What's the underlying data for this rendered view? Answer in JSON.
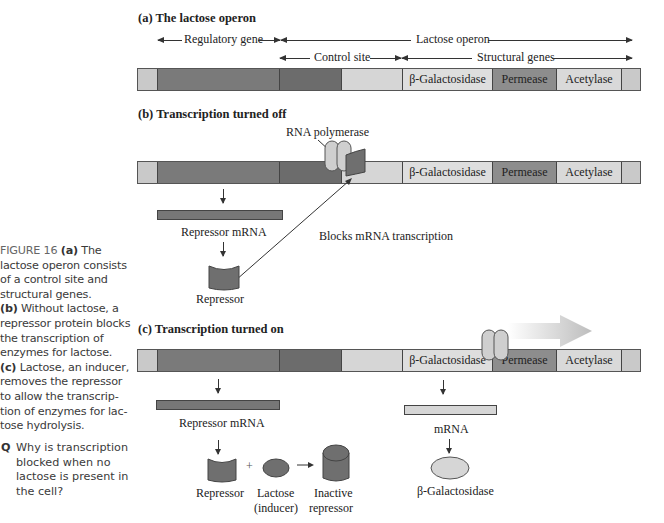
{
  "caption": {
    "figure_label": "FIGURE 16",
    "a_marker": "(a)",
    "a_text": "The lactose operon consists of a control site and structural genes.",
    "b_marker": "(b)",
    "b_text": "Without lactose, a repressor protein blocks the transcription of enzymes for lactose.",
    "c_marker": "(c)",
    "c_text": "Lactose, an inducer, removes the repressor to allow the transcrip-tion of enzymes for lac-tose hydrolysis.",
    "question_marker": "Q",
    "question_text": "Why is transcription blocked when no lactose is present in the cell?"
  },
  "panel_a": {
    "title": "(a) The lactose operon",
    "regulatory_gene": "Regulatory gene",
    "lactose_operon": "Lactose operon",
    "control_site": "Control site",
    "structural_genes": "Structural genes"
  },
  "genes": {
    "galactosidase": "β-Galactosidase",
    "permease": "Permease",
    "acetylase": "Acetylase"
  },
  "panel_b": {
    "title": "(b) Transcription turned off",
    "rna_polymerase": "RNA polymerase",
    "repressor_mrna": "Repressor mRNA",
    "blocks": "Blocks mRNA transcription",
    "repressor": "Repressor"
  },
  "panel_c": {
    "title": "(c) Transcription turned on",
    "repressor_mrna": "Repressor mRNA",
    "mrna": "mRNA",
    "repressor": "Repressor",
    "plus": "+",
    "lactose": "Lactose",
    "inducer": "(inducer)",
    "inactive": "Inactive",
    "repressor2": "repressor",
    "galactosidase": "β-Galactosidase"
  },
  "colors": {
    "dark_segment": "#7a7a7a",
    "light_segment": "#d6d6d6",
    "permease": "#8d8d8d",
    "repressor": "#6f6f6f",
    "polymerase": "#cfcfcf",
    "transcription_arrow": "#c8c8c8"
  }
}
